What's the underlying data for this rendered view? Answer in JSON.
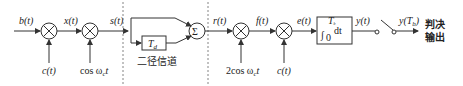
{
  "diagram": {
    "type": "block-diagram",
    "signals": {
      "input": "b(t)",
      "after_spread": "x(t)",
      "transmitted": "s(t)",
      "received": "r(t)",
      "after_demod": "f(t)",
      "after_despread": "e(t)",
      "integrator_out": "y(t)",
      "sampled": "y(T",
      "sampled_sub": "b",
      "sampled_close": ")"
    },
    "multipliers": [
      {
        "symbol": "×",
        "input_below": "c(t)"
      },
      {
        "symbol": "×",
        "input_below": "cos ω",
        "input_below_sub": "c",
        "input_below_tail": "t"
      },
      {
        "symbol": "×",
        "input_below": "2cos ω",
        "input_below_sub": "c",
        "input_below_tail": "t"
      },
      {
        "symbol": "×",
        "input_below": "c(t)"
      }
    ],
    "channel": {
      "label": "二径信道",
      "delay_block": "T",
      "delay_sub": "d",
      "summer": "Σ"
    },
    "integrator": {
      "integral": "∫",
      "upper_limit": "T",
      "upper_limit_sub": "b",
      "lower_limit": "0",
      "body": "dt"
    },
    "output_label_line1": "判决",
    "output_label_line2": "输出"
  }
}
